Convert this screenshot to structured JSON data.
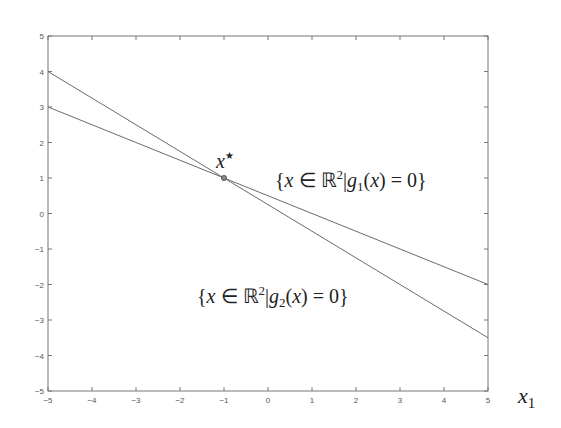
{
  "chart_data": {
    "type": "line",
    "title": "",
    "xlabel": "x_1",
    "ylabel": "",
    "xlim": [
      -5,
      5
    ],
    "ylim": [
      -5,
      5
    ],
    "grid": false,
    "x_ticks": [
      -5,
      -4,
      -3,
      -2,
      -1,
      0,
      1,
      2,
      3,
      4,
      5
    ],
    "y_ticks": [
      -5,
      -4,
      -3,
      -2,
      -1,
      0,
      1,
      2,
      3,
      4,
      5
    ],
    "series": [
      {
        "name": "g1(x) = 0",
        "x": [
          -5,
          5
        ],
        "values": [
          3,
          -2
        ],
        "color": "#6b6b6b"
      },
      {
        "name": "g2(x) = 0",
        "x": [
          -5,
          5
        ],
        "values": [
          4,
          -3.5
        ],
        "color": "#6b6b6b"
      }
    ],
    "points": [
      {
        "name": "x*",
        "x": -1,
        "y": 1
      }
    ],
    "annotations": [
      {
        "id": "xstar",
        "text": "x",
        "sup": "★",
        "x": -1,
        "y": 1
      },
      {
        "id": "g1",
        "parts": [
          "{",
          "x",
          " ∈ ",
          "ℝ",
          "2",
          "|",
          "g",
          "1",
          "(",
          "x",
          ") = 0}"
        ]
      },
      {
        "id": "g2",
        "parts": [
          "{",
          "x",
          " ∈ ",
          "ℝ",
          "2",
          "|",
          "g",
          "2",
          "(",
          "x",
          ") = 0}"
        ]
      }
    ]
  },
  "labels": {
    "xstar_base": "x",
    "xstar_sup": "★",
    "x_axis_base": "x",
    "x_axis_sub": "1",
    "g1": {
      "open": "{",
      "x": "x",
      "in": " ∈ ",
      "R": "ℝ",
      "pow": "2",
      "bar": "|",
      "g": "g",
      "sub": "1",
      "lp": "(",
      "x2": "x",
      "rest": ") = 0}"
    },
    "g2": {
      "open": "{",
      "x": "x",
      "in": " ∈ ",
      "R": "ℝ",
      "pow": "2",
      "bar": "|",
      "g": "g",
      "sub": "2",
      "lp": "(",
      "x2": "x",
      "rest": ") = 0}"
    }
  }
}
